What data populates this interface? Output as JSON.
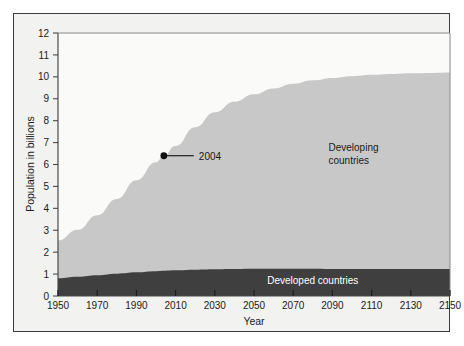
{
  "figure": {
    "background_color": "#ffffff",
    "panel_color": "#f2f2f0",
    "frame_color": "#3a3a3a"
  },
  "chart_data": {
    "type": "area",
    "stacked": true,
    "title": "",
    "xlabel": "Year",
    "ylabel": "Population in billions",
    "xlim": [
      1950,
      2150
    ],
    "ylim": [
      0,
      12
    ],
    "grid": false,
    "legend_position": "inside-annotations",
    "xticks": [
      1950,
      1970,
      1990,
      2010,
      2030,
      2050,
      2070,
      2090,
      2110,
      2130,
      2150
    ],
    "xtick_labels": [
      "1950",
      "1970",
      "1990",
      "2010",
      "2030",
      "2050",
      "2070",
      "2090",
      "2110",
      "2130",
      "2150"
    ],
    "yticks": [
      0,
      1,
      2,
      3,
      4,
      5,
      6,
      7,
      8,
      9,
      10,
      11,
      12
    ],
    "ytick_labels": [
      "0",
      "1",
      "2",
      "3",
      "4",
      "5",
      "6",
      "7",
      "8",
      "9",
      "10",
      "11",
      "12"
    ],
    "x": [
      1950,
      1960,
      1970,
      1980,
      1990,
      2000,
      2004,
      2010,
      2020,
      2030,
      2040,
      2050,
      2060,
      2070,
      2080,
      2090,
      2100,
      2110,
      2120,
      2130,
      2140,
      2150
    ],
    "series": [
      {
        "name": "Developed countries",
        "color": "#3f3f3f",
        "label_color": "#ffffff",
        "values": [
          0.81,
          0.88,
          0.95,
          1.02,
          1.08,
          1.13,
          1.15,
          1.17,
          1.2,
          1.22,
          1.23,
          1.24,
          1.24,
          1.24,
          1.24,
          1.23,
          1.23,
          1.23,
          1.23,
          1.23,
          1.23,
          1.23
        ]
      },
      {
        "name": "Developing countries",
        "color": "#c8c8c8",
        "label_color": "#1a1a1a",
        "values": [
          1.72,
          2.14,
          2.74,
          3.41,
          4.2,
          4.97,
          5.25,
          5.68,
          6.5,
          7.16,
          7.63,
          7.96,
          8.23,
          8.44,
          8.6,
          8.72,
          8.8,
          8.86,
          8.9,
          8.93,
          8.95,
          8.97
        ]
      }
    ],
    "totals": [
      2.53,
      3.02,
      3.69,
      4.43,
      5.28,
      6.1,
      6.4,
      6.85,
      7.7,
      8.38,
      8.86,
      9.2,
      9.47,
      9.68,
      9.84,
      9.95,
      10.03,
      10.09,
      10.13,
      10.16,
      10.18,
      10.2
    ],
    "annotations": [
      {
        "label": "2004",
        "x": 2004,
        "y": 6.4,
        "marker": "dot",
        "marker_color": "#111111"
      }
    ],
    "series_labels": [
      {
        "text_line1": "Developing",
        "text_line2": "countries",
        "x": 2088,
        "y": 6.6
      },
      {
        "text_line1": "Developed countries",
        "text_line2": "",
        "x": 2080,
        "y": 0.55
      }
    ]
  }
}
